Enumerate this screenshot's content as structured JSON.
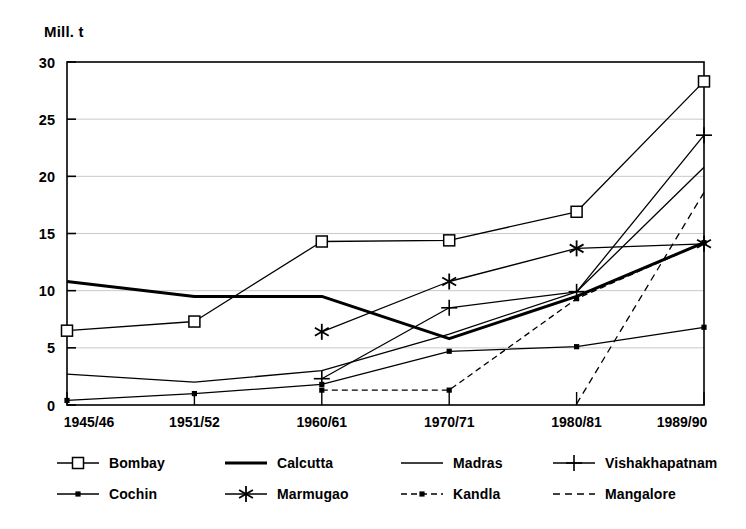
{
  "chart_data": {
    "type": "line",
    "title": "",
    "subtitle": "",
    "xlabel": "",
    "ylabel": "Mill. t",
    "categories": [
      "1945/46",
      "1951/52",
      "1960/61",
      "1970/71",
      "1980/81",
      "1989/90"
    ],
    "ylim": [
      0,
      30
    ],
    "yticks": [
      0,
      5,
      10,
      15,
      20,
      25,
      30
    ],
    "grid": true,
    "legend_position": "bottom",
    "series": [
      {
        "name": "Bombay",
        "marker": "open-square",
        "line_style": "solid",
        "line_weight": "thin",
        "color": "#000000",
        "values": [
          6.5,
          7.3,
          14.3,
          14.4,
          16.9,
          28.3
        ]
      },
      {
        "name": "Calcutta",
        "marker": "none",
        "line_style": "solid",
        "line_weight": "thick",
        "color": "#000000",
        "values": [
          10.8,
          9.5,
          9.5,
          5.8,
          9.5,
          14.2
        ]
      },
      {
        "name": "Madras",
        "marker": "none",
        "line_style": "solid",
        "line_weight": "thin",
        "color": "#000000",
        "values": [
          2.7,
          2.0,
          3.0,
          6.2,
          9.9,
          20.8
        ]
      },
      {
        "name": "Vishakhapatnam",
        "marker": "plus",
        "line_style": "solid",
        "line_weight": "thin",
        "color": "#000000",
        "values": [
          null,
          null,
          2.3,
          8.5,
          9.9,
          23.6
        ]
      },
      {
        "name": "Cochin",
        "marker": "dot",
        "line_style": "solid",
        "line_weight": "thin",
        "color": "#000000",
        "values": [
          0.4,
          1.0,
          1.8,
          4.7,
          5.1,
          6.8
        ]
      },
      {
        "name": "Marmugao",
        "marker": "asterisk",
        "line_style": "solid",
        "line_weight": "thin",
        "color": "#000000",
        "values": [
          null,
          null,
          6.4,
          10.8,
          13.7,
          14.1
        ]
      },
      {
        "name": "Kandla",
        "marker": "dot",
        "line_style": "dash-dot",
        "line_weight": "thin",
        "color": "#000000",
        "values": [
          null,
          null,
          1.3,
          1.3,
          9.3,
          14.2
        ]
      },
      {
        "name": "Mangalore",
        "marker": "none",
        "line_style": "dashed",
        "line_weight": "thin",
        "color": "#000000",
        "values": [
          null,
          null,
          null,
          null,
          0.1,
          18.6
        ]
      }
    ]
  },
  "legend": {
    "items": [
      {
        "label": "Bombay",
        "sample": "line-open-square-marker"
      },
      {
        "label": "Calcutta",
        "sample": "thick-solid-line"
      },
      {
        "label": "Madras",
        "sample": "thin-solid-line"
      },
      {
        "label": "Vishakhapatnam",
        "sample": "line-plus-marker"
      },
      {
        "label": "Cochin",
        "sample": "line-dot-marker"
      },
      {
        "label": "Marmugao",
        "sample": "line-asterisk-marker"
      },
      {
        "label": "Kandla",
        "sample": "dash-dot-line-dot-marker"
      },
      {
        "label": "Mangalore",
        "sample": "dashed-line"
      }
    ]
  },
  "axes": {
    "y_unit_label": "Mill. t",
    "y_tick_labels": [
      "0",
      "5",
      "10",
      "15",
      "20",
      "25",
      "30"
    ],
    "x_tick_labels": [
      "1945/46",
      "1951/52",
      "1960/61",
      "1970/71",
      "1980/81",
      "1989/90"
    ]
  }
}
